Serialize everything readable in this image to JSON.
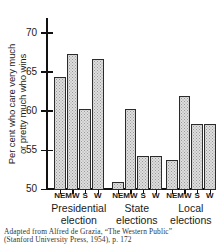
{
  "chart_data": {
    "type": "bar",
    "title": "",
    "xlabel": "",
    "ylabel_line1": "Per cent who care very much",
    "ylabel_line2": "or pretty much who wins",
    "ylim": [
      50,
      72
    ],
    "yticks": [
      50,
      55,
      60,
      65,
      70
    ],
    "ytick_labels": [
      "50",
      "55",
      "60",
      "65",
      "70"
    ],
    "grid": false,
    "legend": "none",
    "categories": [
      "NE",
      "MW",
      "S",
      "W"
    ],
    "groups": [
      {
        "name": "Presidential election",
        "label_line1": "Presidential",
        "label_line2": "election",
        "values": [
          64.4,
          67.4,
          60.4,
          66.8
        ]
      },
      {
        "name": "State elections",
        "label_line1": "State",
        "label_line2": "elections",
        "values": [
          51.0,
          60.4,
          54.3,
          54.3
        ]
      },
      {
        "name": "Local elections",
        "label_line1": "Local",
        "label_line2": "elections",
        "values": [
          53.9,
          62.0,
          58.5,
          58.5
        ]
      }
    ],
    "bar_color": "#dedede",
    "bar_edge_color": "#2b2b2b",
    "axis_color": "#111111"
  },
  "caption": {
    "line1": "Adapted from Alfred de Grazia, “The Western Public”",
    "line2": "(Stanford University Press, 1954), p. 172"
  }
}
